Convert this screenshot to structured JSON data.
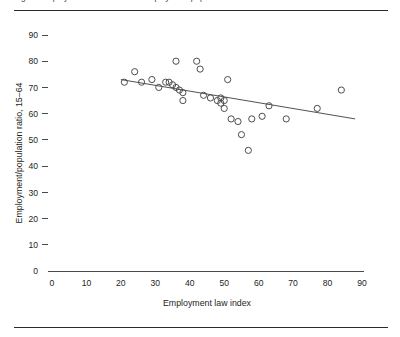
{
  "figure": {
    "clipped_top_caption": "Figure   Employment law index and employment/population ratio"
  },
  "chart_data": {
    "type": "scatter",
    "title": "",
    "xlabel": "Employment law index",
    "ylabel": "Employment/population ratio, 15–64",
    "xlim": [
      0,
      90
    ],
    "ylim": [
      0,
      90
    ],
    "xticks": [
      0,
      10,
      20,
      30,
      40,
      50,
      60,
      70,
      80,
      90
    ],
    "yticks": [
      0,
      10,
      20,
      30,
      40,
      50,
      60,
      70,
      80,
      90
    ],
    "grid": false,
    "legend": false,
    "marker": "open-circle",
    "points": [
      {
        "x": 21,
        "y": 72
      },
      {
        "x": 24,
        "y": 76
      },
      {
        "x": 26,
        "y": 72
      },
      {
        "x": 29,
        "y": 73
      },
      {
        "x": 31,
        "y": 70
      },
      {
        "x": 33,
        "y": 72
      },
      {
        "x": 34,
        "y": 72
      },
      {
        "x": 35,
        "y": 71
      },
      {
        "x": 36,
        "y": 80
      },
      {
        "x": 36,
        "y": 70
      },
      {
        "x": 37,
        "y": 69
      },
      {
        "x": 38,
        "y": 68
      },
      {
        "x": 38,
        "y": 65
      },
      {
        "x": 42,
        "y": 80
      },
      {
        "x": 43,
        "y": 77
      },
      {
        "x": 44,
        "y": 67
      },
      {
        "x": 46,
        "y": 66
      },
      {
        "x": 48,
        "y": 65
      },
      {
        "x": 49,
        "y": 66
      },
      {
        "x": 49,
        "y": 64
      },
      {
        "x": 50,
        "y": 65
      },
      {
        "x": 50,
        "y": 62
      },
      {
        "x": 51,
        "y": 73
      },
      {
        "x": 52,
        "y": 58
      },
      {
        "x": 54,
        "y": 57
      },
      {
        "x": 55,
        "y": 52
      },
      {
        "x": 57,
        "y": 46
      },
      {
        "x": 58,
        "y": 58
      },
      {
        "x": 61,
        "y": 59
      },
      {
        "x": 63,
        "y": 63
      },
      {
        "x": 68,
        "y": 58
      },
      {
        "x": 77,
        "y": 62
      },
      {
        "x": 84,
        "y": 69
      }
    ],
    "trendline": {
      "x_start": 20,
      "y_start": 73,
      "x_end": 88,
      "y_end": 58
    }
  }
}
